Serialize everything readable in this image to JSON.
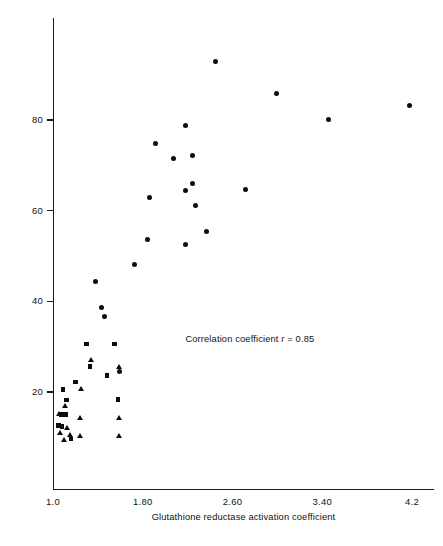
{
  "chart_data": {
    "type": "scatter",
    "title": "",
    "xlabel": "Glutathione reductase activation coefficient",
    "ylabel": "Percentage of haemolysis",
    "xlim": [
      1.0,
      4.2
    ],
    "ylim": [
      6,
      96
    ],
    "grid": false,
    "legend_position": "none",
    "annotations": [
      {
        "name": "correlation-note",
        "text_prefix": "Correlation coefficient ",
        "text_symbol": "r",
        "text_suffix": " = 0.85",
        "x": 2.18,
        "y": 31.5
      }
    ],
    "xticks": [
      {
        "value": 1.0,
        "label": "1.0"
      },
      {
        "value": 1.8,
        "label": "1.80"
      },
      {
        "value": 2.6,
        "label": "2.60"
      },
      {
        "value": 3.4,
        "label": "3.40"
      },
      {
        "value": 4.2,
        "label": "4.2"
      }
    ],
    "yticks": [
      {
        "value": 20,
        "label": "20"
      },
      {
        "value": 40,
        "label": "40"
      },
      {
        "value": 60,
        "label": "60"
      },
      {
        "value": 80,
        "label": "80"
      }
    ],
    "series": [
      {
        "name": "circles",
        "marker": "circle",
        "color": "#0d0d0d",
        "points": [
          {
            "x": 2.45,
            "y": 93.0
          },
          {
            "x": 2.99,
            "y": 85.8
          },
          {
            "x": 3.46,
            "y": 80.2
          },
          {
            "x": 4.18,
            "y": 83.2
          },
          {
            "x": 2.18,
            "y": 78.8
          },
          {
            "x": 1.91,
            "y": 74.8
          },
          {
            "x": 2.24,
            "y": 72.2
          },
          {
            "x": 2.07,
            "y": 71.4
          },
          {
            "x": 2.24,
            "y": 66.0
          },
          {
            "x": 2.18,
            "y": 64.4
          },
          {
            "x": 2.72,
            "y": 64.6
          },
          {
            "x": 1.86,
            "y": 63.0
          },
          {
            "x": 2.27,
            "y": 61.2
          },
          {
            "x": 2.37,
            "y": 55.4
          },
          {
            "x": 2.18,
            "y": 52.6
          },
          {
            "x": 1.84,
            "y": 53.6
          },
          {
            "x": 1.73,
            "y": 48.2
          },
          {
            "x": 1.38,
            "y": 44.4
          },
          {
            "x": 1.43,
            "y": 38.6
          },
          {
            "x": 1.46,
            "y": 36.6
          },
          {
            "x": 1.59,
            "y": 24.6
          }
        ]
      },
      {
        "name": "squares",
        "marker": "square",
        "color": "#0d0d0d",
        "points": [
          {
            "x": 1.3,
            "y": 30.6
          },
          {
            "x": 1.55,
            "y": 30.6
          },
          {
            "x": 1.33,
            "y": 25.6
          },
          {
            "x": 1.48,
            "y": 23.6
          },
          {
            "x": 1.2,
            "y": 22.2
          },
          {
            "x": 1.09,
            "y": 20.6
          },
          {
            "x": 1.58,
            "y": 18.4
          },
          {
            "x": 1.12,
            "y": 18.2
          },
          {
            "x": 1.07,
            "y": 15.0
          },
          {
            "x": 1.11,
            "y": 15.0
          },
          {
            "x": 1.05,
            "y": 12.6
          },
          {
            "x": 1.08,
            "y": 12.4
          },
          {
            "x": 1.16,
            "y": 9.6
          }
        ]
      },
      {
        "name": "triangles",
        "marker": "triangle",
        "color": "#0d0d0d",
        "points": [
          {
            "x": 1.34,
            "y": 27.2
          },
          {
            "x": 1.59,
            "y": 25.6
          },
          {
            "x": 1.25,
            "y": 20.6
          },
          {
            "x": 1.11,
            "y": 17.0
          },
          {
            "x": 1.05,
            "y": 15.2
          },
          {
            "x": 1.24,
            "y": 14.2
          },
          {
            "x": 1.59,
            "y": 14.2
          },
          {
            "x": 1.13,
            "y": 12.2
          },
          {
            "x": 1.06,
            "y": 11.0
          },
          {
            "x": 1.15,
            "y": 10.6
          },
          {
            "x": 1.24,
            "y": 10.4
          },
          {
            "x": 1.59,
            "y": 10.4
          },
          {
            "x": 1.1,
            "y": 9.4
          }
        ]
      }
    ]
  }
}
